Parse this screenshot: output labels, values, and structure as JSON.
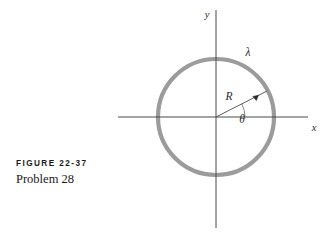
{
  "figure": {
    "caption_label": "FIGURE 22-37",
    "caption_subtitle": "Problem 28",
    "background_color": "#ffffff"
  },
  "diagram": {
    "type": "geometry-diagram",
    "axes": {
      "x_label": "x",
      "y_label": "y",
      "origin": {
        "x": 216,
        "y": 117
      },
      "x_axis": {
        "x1": 118,
        "y1": 117,
        "x2": 308,
        "y2": 117
      },
      "y_axis": {
        "x1": 216,
        "y1": 10,
        "x2": 216,
        "y2": 228
      },
      "color": "#4a4a4a",
      "stroke_width": 1
    },
    "ring": {
      "center_x": 216,
      "center_y": 117,
      "radius": 58,
      "color": "#9b9b9b",
      "stroke_width": 4.2,
      "charge_density_label": "λ",
      "charge_density_label_x": 248,
      "charge_density_label_y": 56
    },
    "radius_vector": {
      "label": "R",
      "label_x": 226,
      "label_y": 100,
      "from_x": 216,
      "from_y": 117,
      "to_x": 267,
      "to_y": 91,
      "color": "#4a4a4a",
      "stroke_width": 0.9
    },
    "angle": {
      "label": "θ",
      "label_x": 241,
      "label_y": 122,
      "value_degrees": 27,
      "arc_radius": 29,
      "color": "#6a6a6a",
      "stroke_width": 0.8
    }
  }
}
